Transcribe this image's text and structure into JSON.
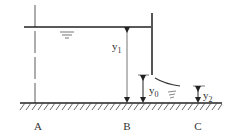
{
  "diagram": {
    "type": "sluice-gate-flow",
    "labels": {
      "section_a": "A",
      "section_b": "B",
      "section_c": "C",
      "depth_upstream": "y",
      "depth_upstream_sub": "1",
      "depth_gate": "y",
      "depth_gate_sub": "0",
      "depth_downstream": "y",
      "depth_downstream_sub": "2"
    },
    "colors": {
      "line": "#222222",
      "gate": "#555555",
      "hatch": "#444444",
      "text": "#333333"
    }
  }
}
